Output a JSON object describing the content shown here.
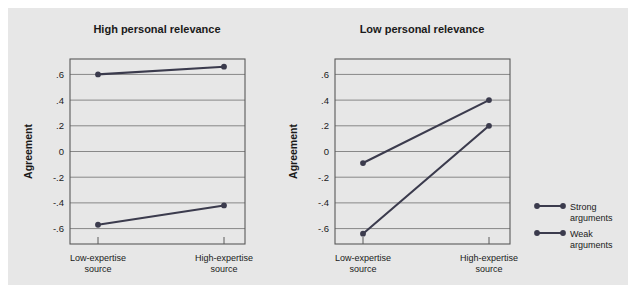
{
  "figure": {
    "background_color": "#e7e7e7",
    "outer_color": "#ffffff",
    "series_color": "#3b3b4d",
    "grid_color": "#7d7d7d"
  },
  "legend": {
    "position": "right",
    "entries": [
      {
        "label_line1": "Strong",
        "label_line2": "arguments",
        "key": "strong"
      },
      {
        "label_line1": "Weak",
        "label_line2": "arguments",
        "key": "weak"
      }
    ]
  },
  "chart_data": [
    {
      "type": "line",
      "title": "High personal relevance",
      "xlabel": "",
      "ylabel": "Agreement",
      "categories": [
        "Low-expertise source",
        "High-expertise source"
      ],
      "category_lines": [
        {
          "line1": "Low-expertise",
          "line2": "source"
        },
        {
          "line1": "High-expertise",
          "line2": "source"
        }
      ],
      "yticks": [
        ".6",
        ".4",
        ".2",
        "0",
        "-.2",
        "-.4",
        "-.6"
      ],
      "ytick_values": [
        0.6,
        0.4,
        0.2,
        0,
        -0.2,
        -0.4,
        -0.6
      ],
      "ylim": [
        -0.72,
        0.72
      ],
      "grid": true,
      "legend_position": "right",
      "series": [
        {
          "name": "Strong arguments",
          "values": [
            0.6,
            0.66
          ]
        },
        {
          "name": "Weak arguments",
          "values": [
            -0.57,
            -0.42
          ]
        }
      ]
    },
    {
      "type": "line",
      "title": "Low personal relevance",
      "xlabel": "",
      "ylabel": "Agreement",
      "categories": [
        "Low-expertise source",
        "High-expertise source"
      ],
      "category_lines": [
        {
          "line1": "Low-expertise",
          "line2": "source"
        },
        {
          "line1": "High-expertise",
          "line2": "source"
        }
      ],
      "yticks": [
        ".6",
        ".4",
        ".2",
        "0",
        "-.2",
        "-.4",
        "-.6"
      ],
      "ytick_values": [
        0.6,
        0.4,
        0.2,
        0,
        -0.2,
        -0.4,
        -0.6
      ],
      "ylim": [
        -0.72,
        0.72
      ],
      "grid": true,
      "legend_position": "right",
      "series": [
        {
          "name": "Strong arguments",
          "values": [
            -0.09,
            0.4
          ]
        },
        {
          "name": "Weak arguments",
          "values": [
            -0.64,
            0.2
          ]
        }
      ]
    }
  ]
}
